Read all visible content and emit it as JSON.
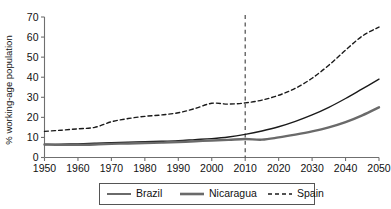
{
  "chart_data": {
    "type": "line",
    "title": "",
    "xlabel": "",
    "ylabel": "% working-age population",
    "xlim": [
      1950,
      2050
    ],
    "ylim": [
      0,
      70
    ],
    "grid": false,
    "legend_position": "bottom",
    "x_ticks": [
      "1950",
      "1960",
      "1970",
      "1980",
      "1990",
      "2000",
      "2010",
      "2020",
      "2030",
      "2040",
      "2050"
    ],
    "y_ticks": [
      "0",
      "10",
      "20",
      "30",
      "40",
      "50",
      "60",
      "70"
    ],
    "x": [
      1950,
      1955,
      1960,
      1965,
      1970,
      1975,
      1980,
      1985,
      1990,
      1995,
      2000,
      2005,
      2010,
      2015,
      2020,
      2025,
      2030,
      2035,
      2040,
      2045,
      2050
    ],
    "series": [
      {
        "name": "Brazil",
        "style": "solid-thin",
        "color": "#1a1a1a",
        "values": [
          6.5,
          6.6,
          6.8,
          7.1,
          7.4,
          7.6,
          7.9,
          8.1,
          8.4,
          8.9,
          9.4,
          10.2,
          11.5,
          13.2,
          15.3,
          18.0,
          21.2,
          25.0,
          29.4,
          34.2,
          39.0
        ]
      },
      {
        "name": "Nicaragua",
        "style": "solid-thick",
        "color": "#6a6a6a",
        "values": [
          6.5,
          6.3,
          6.3,
          6.5,
          6.8,
          7.0,
          7.2,
          7.4,
          7.7,
          8.1,
          8.5,
          8.8,
          9.2,
          8.9,
          10.0,
          11.4,
          13.0,
          15.0,
          17.6,
          21.0,
          25.0
        ]
      },
      {
        "name": "Spain",
        "style": "dashed",
        "color": "#1a1a1a",
        "values": [
          13.0,
          13.6,
          14.3,
          15.0,
          17.8,
          19.4,
          20.5,
          21.2,
          22.3,
          24.4,
          27.0,
          26.6,
          27.2,
          28.6,
          31.0,
          34.5,
          39.5,
          46.0,
          53.5,
          60.5,
          65.0
        ]
      }
    ],
    "reference_line": {
      "name": "year-2010-marker",
      "x": 2010,
      "style": "dashed"
    }
  },
  "legend": {
    "items": [
      {
        "label": "Brazil"
      },
      {
        "label": "Nicaragua"
      },
      {
        "label": "Spain"
      }
    ]
  }
}
